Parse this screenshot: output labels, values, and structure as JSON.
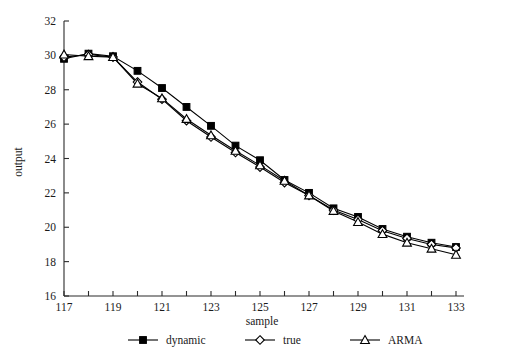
{
  "chart_data": {
    "type": "line",
    "title": "",
    "subtitle": "",
    "xlabel": "sample",
    "ylabel": "output",
    "x": [
      117,
      118,
      119,
      120,
      121,
      122,
      123,
      124,
      125,
      126,
      127,
      128,
      129,
      130,
      131,
      132,
      133
    ],
    "xlim": [
      117,
      133
    ],
    "ylim": [
      16,
      32
    ],
    "xticks": [
      117,
      118,
      119,
      120,
      121,
      122,
      123,
      124,
      125,
      126,
      127,
      128,
      129,
      130,
      131,
      132,
      133
    ],
    "xtick_labels": [
      "117",
      "",
      "119",
      "",
      "121",
      "",
      "123",
      "",
      "125",
      "",
      "127",
      "",
      "129",
      "",
      "131",
      "",
      "133"
    ],
    "yticks": [
      16,
      18,
      20,
      22,
      24,
      26,
      28,
      30,
      32
    ],
    "ytick_labels": [
      "16",
      "18",
      "20",
      "22",
      "24",
      "26",
      "28",
      "30",
      "32"
    ],
    "grid": false,
    "legend_position": "below",
    "series": [
      {
        "name": "dynamic",
        "marker": "filled-square",
        "color": "#000000",
        "values": [
          29.8,
          30.1,
          29.95,
          29.1,
          28.1,
          27.0,
          25.9,
          24.75,
          23.9,
          22.75,
          22.0,
          21.1,
          20.6,
          19.9,
          19.45,
          19.1,
          18.85
        ]
      },
      {
        "name": "true",
        "marker": "open-diamond",
        "color": "#000000",
        "values": [
          29.9,
          30.05,
          29.9,
          28.45,
          27.45,
          26.2,
          25.25,
          24.35,
          23.5,
          22.6,
          21.85,
          21.0,
          20.45,
          19.8,
          19.35,
          19.0,
          18.8
        ]
      },
      {
        "name": "ARMA",
        "marker": "open-triangle",
        "color": "#000000",
        "values": [
          30.05,
          29.95,
          29.9,
          28.35,
          27.5,
          26.3,
          25.35,
          24.45,
          23.6,
          22.7,
          21.85,
          20.95,
          20.3,
          19.6,
          19.1,
          18.75,
          18.4
        ]
      }
    ]
  },
  "axes": {
    "xlabel": "sample",
    "ylabel": "output"
  },
  "legend": {
    "items": [
      {
        "label": "dynamic",
        "marker": "filled-square"
      },
      {
        "label": "true",
        "marker": "open-diamond"
      },
      {
        "label": "ARMA",
        "marker": "open-triangle"
      }
    ]
  }
}
